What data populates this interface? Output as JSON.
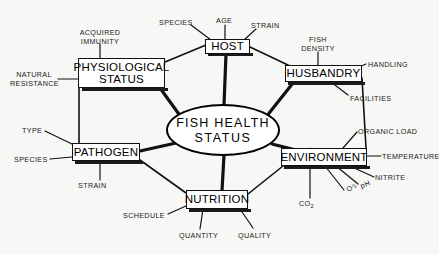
{
  "diagram": {
    "center": {
      "name": "fish-health-status",
      "line1": "FISH   HEALTH",
      "line2": "STATUS"
    },
    "nodes": [
      {
        "id": "physiological-status",
        "label": "PHYSIOLOGICAL\nSTATUS",
        "line1": "PHYSIOLOGICAL",
        "line2": "STATUS"
      },
      {
        "id": "host",
        "label": "HOST"
      },
      {
        "id": "husbandry",
        "label": "HUSBANDRY"
      },
      {
        "id": "environment",
        "label": "ENVIRONMENT"
      },
      {
        "id": "nutrition",
        "label": "NUTRITION"
      },
      {
        "id": "pathogen",
        "label": "PATHOGEN"
      }
    ],
    "leaves": {
      "acquired_immunity_1": "ACQUIRED",
      "acquired_immunity_2": "IMMUNITY",
      "natural_resistance_1": "NATURAL",
      "natural_resistance_2": "RESISTANCE",
      "species_host": "SPECIES",
      "age": "AGE",
      "strain_host": "STRAIN",
      "fish_density_1": "FISH",
      "fish_density_2": "DENSITY",
      "handling": "HANDLING",
      "facilities": "FACILITIES",
      "organic_load": "ORGANIC LOAD",
      "temperature": "TEMPERATURE",
      "nitrite": "NITRITE",
      "ph": "pH",
      "oxygen": "O",
      "oxygen_sub": "2",
      "carbon_dioxide": "CO",
      "carbon_dioxide_sub": "2",
      "quality": "QUALITY",
      "quantity": "QUANTITY",
      "schedule": "SCHEDULE",
      "strain_pathogen": "STRAIN",
      "species_pathogen": "SPECIES",
      "type_pathogen": "TYPE"
    },
    "colors": {
      "stroke": "#111111",
      "fill": "#ffffff",
      "background": "#f7f7f5",
      "text": "#000000"
    }
  }
}
